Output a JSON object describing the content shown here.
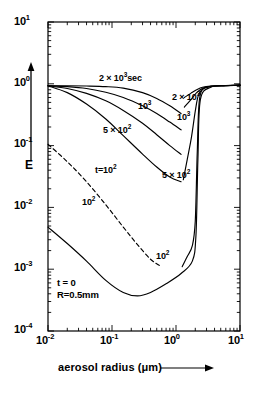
{
  "chart_data": {
    "type": "line",
    "title": "",
    "xlabel": "aerosol radius (μm)",
    "ylabel": "E",
    "xscale": "log",
    "yscale": "log",
    "xlim": [
      0.01,
      10
    ],
    "ylim": [
      0.0001,
      10
    ],
    "grid": false,
    "legend": "inline-curve-labels",
    "x_ticks": [
      {
        "value": 0.01,
        "mantissa": "10",
        "exponent": "-2"
      },
      {
        "value": 0.1,
        "mantissa": "10",
        "exponent": "-1"
      },
      {
        "value": 1,
        "mantissa": "10",
        "exponent": "0"
      },
      {
        "value": 10,
        "mantissa": "10",
        "exponent": "1"
      }
    ],
    "y_ticks": [
      {
        "value": 10,
        "mantissa": "10",
        "exponent": "1"
      },
      {
        "value": 1,
        "mantissa": "10",
        "exponent": "0"
      },
      {
        "value": 0.1,
        "mantissa": "10",
        "exponent": "-1"
      },
      {
        "value": 0.01,
        "mantissa": "10",
        "exponent": "-2"
      },
      {
        "value": 0.001,
        "mantissa": "10",
        "exponent": "-3"
      },
      {
        "value": 0.0001,
        "mantissa": "10",
        "exponent": "-4"
      }
    ],
    "annotations": [
      {
        "id": "t0",
        "line1": "t = 0",
        "line2": "R=0.5mm"
      }
    ],
    "series": [
      {
        "name": "2x10^3 sec (left branch)",
        "label_mantissa": "2 × 10",
        "label_exponent": "3",
        "label_suffix": "sec",
        "style": "solid",
        "points": [
          [
            0.01,
            0.93
          ],
          [
            0.02,
            0.93
          ],
          [
            0.04,
            0.92
          ],
          [
            0.08,
            0.9
          ],
          [
            0.15,
            0.85
          ],
          [
            0.3,
            0.72
          ],
          [
            0.5,
            0.58
          ],
          [
            0.8,
            0.44
          ],
          [
            1.2,
            0.33
          ]
        ]
      },
      {
        "name": "10^3 (left branch)",
        "label_mantissa": "10",
        "label_exponent": "3",
        "label_suffix": "",
        "style": "solid",
        "points": [
          [
            0.01,
            0.93
          ],
          [
            0.02,
            0.9
          ],
          [
            0.04,
            0.84
          ],
          [
            0.08,
            0.73
          ],
          [
            0.15,
            0.6
          ],
          [
            0.3,
            0.44
          ],
          [
            0.5,
            0.33
          ],
          [
            0.8,
            0.24
          ],
          [
            1.2,
            0.18
          ]
        ]
      },
      {
        "name": "5x10^2 (left branch)",
        "label_mantissa": "5 × 10",
        "label_exponent": "2",
        "label_suffix": "",
        "style": "solid",
        "points": [
          [
            0.01,
            0.93
          ],
          [
            0.02,
            0.84
          ],
          [
            0.04,
            0.7
          ],
          [
            0.08,
            0.53
          ],
          [
            0.15,
            0.37
          ],
          [
            0.3,
            0.23
          ],
          [
            0.5,
            0.15
          ],
          [
            0.8,
            0.1
          ],
          [
            1.2,
            0.072
          ]
        ]
      },
      {
        "name": "t=10^2 (left branch)",
        "label_mantissa": "t=10",
        "label_exponent": "2",
        "label_suffix": "",
        "style": "solid",
        "points": [
          [
            0.01,
            0.93
          ],
          [
            0.02,
            0.72
          ],
          [
            0.04,
            0.47
          ],
          [
            0.08,
            0.27
          ],
          [
            0.15,
            0.145
          ],
          [
            0.3,
            0.073
          ],
          [
            0.5,
            0.045
          ],
          [
            0.8,
            0.031
          ],
          [
            1.2,
            0.026
          ]
        ]
      },
      {
        "name": "10^2 dashed (left branch)",
        "label_mantissa": "10",
        "label_exponent": "2",
        "label_suffix": "",
        "style": "dashed",
        "points": [
          [
            0.01,
            0.105
          ],
          [
            0.02,
            0.055
          ],
          [
            0.04,
            0.026
          ],
          [
            0.08,
            0.011
          ],
          [
            0.15,
            0.0048
          ],
          [
            0.25,
            0.0025
          ],
          [
            0.4,
            0.00145
          ],
          [
            0.55,
            0.00115
          ]
        ]
      },
      {
        "name": "t=0 R=0.5mm baseline",
        "label_mantissa": "",
        "label_exponent": "",
        "label_suffix": "",
        "style": "solid",
        "points": [
          [
            0.01,
            0.0048
          ],
          [
            0.02,
            0.0026
          ],
          [
            0.04,
            0.00135
          ],
          [
            0.08,
            0.00066
          ],
          [
            0.15,
            0.00042
          ],
          [
            0.25,
            0.00037
          ],
          [
            0.4,
            0.00042
          ],
          [
            0.7,
            0.00058
          ],
          [
            1.2,
            0.00085
          ],
          [
            1.8,
            0.00135
          ],
          [
            2.05,
            0.0035
          ],
          [
            2.2,
            0.06
          ],
          [
            2.4,
            0.55
          ],
          [
            3.5,
            0.88
          ],
          [
            6,
            0.93
          ],
          [
            10,
            0.95
          ]
        ]
      },
      {
        "name": "2x10^3 (right branch)",
        "label_mantissa": "2 × 10",
        "label_exponent": "3",
        "label_suffix": "",
        "style": "solid",
        "points": [
          [
            1.35,
            0.6
          ],
          [
            1.7,
            0.7
          ],
          [
            2.1,
            0.8
          ],
          [
            2.6,
            0.88
          ],
          [
            3.5,
            0.92
          ],
          [
            6,
            0.94
          ],
          [
            10,
            0.95
          ]
        ]
      },
      {
        "name": "10^3 (right branch)",
        "label_mantissa": "10",
        "label_exponent": "3",
        "label_suffix": "",
        "style": "solid",
        "points": [
          [
            1.35,
            0.42
          ],
          [
            1.7,
            0.55
          ],
          [
            2.1,
            0.72
          ],
          [
            2.6,
            0.85
          ],
          [
            3.5,
            0.91
          ],
          [
            6,
            0.94
          ],
          [
            10,
            0.95
          ]
        ]
      },
      {
        "name": "5x10^2 (right branch)",
        "label_mantissa": "5 × 10",
        "label_exponent": "2",
        "label_suffix": "",
        "style": "solid",
        "points": [
          [
            1.3,
            0.028
          ],
          [
            1.5,
            0.06
          ],
          [
            1.75,
            0.14
          ],
          [
            2.0,
            0.36
          ],
          [
            2.25,
            0.66
          ],
          [
            2.8,
            0.86
          ],
          [
            4,
            0.92
          ],
          [
            7,
            0.94
          ],
          [
            10,
            0.95
          ]
        ]
      },
      {
        "name": "10^2 (right branch)",
        "label_mantissa": "10",
        "label_exponent": "2",
        "label_suffix": "",
        "style": "solid",
        "points": [
          [
            1.25,
            0.0011
          ],
          [
            1.5,
            0.0016
          ],
          [
            1.8,
            0.0024
          ],
          [
            2.0,
            0.006
          ],
          [
            2.15,
            0.08
          ],
          [
            2.35,
            0.6
          ],
          [
            3.2,
            0.89
          ],
          [
            6,
            0.93
          ],
          [
            10,
            0.95
          ]
        ]
      }
    ]
  }
}
